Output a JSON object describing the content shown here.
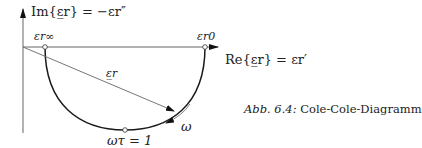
{
  "diagram": {
    "type": "cole-cole-plot",
    "axes": {
      "y_label": "Im{ε̲r} = −εr″",
      "x_label": "Re{ε̲r} = εr′"
    },
    "points": {
      "eps_inf": "εr∞",
      "eps_0": "εr0",
      "peak": "ωτ = 1"
    },
    "vector_label": "ε̲r",
    "direction_label": "ω",
    "colors": {
      "curve": "#1a1a1a",
      "axis": "#555555",
      "vector": "#666666"
    }
  },
  "caption": {
    "prefix": "Abb. 6.4:",
    "text": " Cole-Cole-Diagramm"
  }
}
